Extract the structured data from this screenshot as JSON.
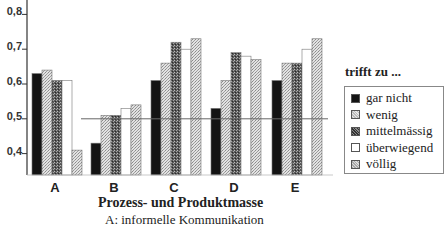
{
  "chart_data": {
    "type": "bar",
    "title": "",
    "xlabel": "Prozess- und Produktmasse",
    "ylabel": "",
    "caption": "A: informelle Kommunikation",
    "categories": [
      "A",
      "B",
      "C",
      "D",
      "E"
    ],
    "ylim": [
      0.35,
      0.85
    ],
    "yticks": [
      "0,4",
      "0,5",
      "0,6",
      "0,7",
      "0,8"
    ],
    "ytick_values": [
      0.4,
      0.5,
      0.6,
      0.7,
      0.8
    ],
    "reference_line": 0.5,
    "grid": false,
    "legend_title": "trifft zu ...",
    "legend_position": "right",
    "series": [
      {
        "name": "gar nicht",
        "color": "#111111",
        "pattern": "solid-black",
        "values": [
          0.63,
          0.43,
          0.61,
          0.53,
          0.61
        ]
      },
      {
        "name": "wenig",
        "color": "#c8c8c8",
        "pattern": "light-stipple",
        "values": [
          0.64,
          0.51,
          0.66,
          0.61,
          0.66
        ]
      },
      {
        "name": "mittelmässig",
        "color": "#6a6a6a",
        "pattern": "dark-stipple",
        "values": [
          0.61,
          0.51,
          0.72,
          0.69,
          0.66
        ]
      },
      {
        "name": "überwiegend",
        "color": "#ffffff",
        "pattern": "white",
        "values": [
          0.61,
          0.53,
          0.7,
          0.68,
          0.7
        ]
      },
      {
        "name": "völlig",
        "color": "#bdbdbd",
        "pattern": "light-stipple",
        "values": [
          0.41,
          0.54,
          0.73,
          0.67,
          0.73
        ]
      }
    ]
  }
}
